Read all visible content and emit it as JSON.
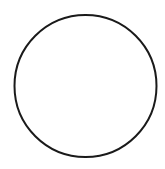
{
  "canvas": {
    "width": 165,
    "height": 169,
    "background": "#ffffff"
  },
  "shapes": [
    {
      "type": "circle",
      "cx": 85.5,
      "cy": 86,
      "r": 71,
      "stroke": "#1a1a1a",
      "stroke_width": 2,
      "fill": "none"
    }
  ]
}
